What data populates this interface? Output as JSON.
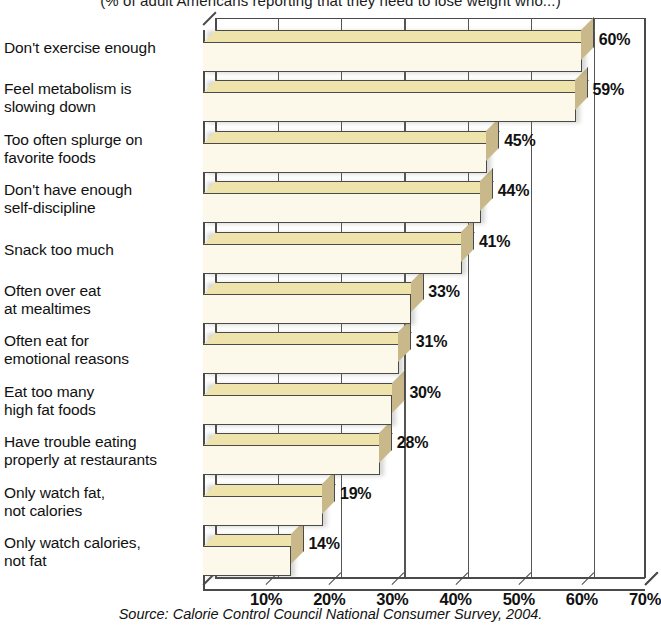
{
  "chart_data": {
    "type": "bar",
    "orientation": "horizontal",
    "title": "(% of adult Americans reporting that they need to lose weight who...)",
    "xlabel": "",
    "ylabel": "",
    "xlim": [
      0,
      70
    ],
    "grid": true,
    "legend": null,
    "source": "Source: Calorie Control Council National Consumer Survey, 2004.",
    "categories": [
      "Don't exercise enough",
      "Feel metabolism is slowing down",
      "Too often splurge on favorite foods",
      "Don't have enough self-discipline",
      "Snack too much",
      "Often over eat at mealtimes",
      "Often eat for emotional reasons",
      "Eat too many high fat foods",
      "Have trouble eating properly at restaurants",
      "Only watch fat, not calories",
      "Only watch calories, not fat"
    ],
    "category_lines": [
      [
        "Don't exercise enough"
      ],
      [
        "Feel metabolism is",
        "slowing down"
      ],
      [
        "Too often splurge on",
        "favorite foods"
      ],
      [
        "Don't have enough",
        "self-discipline"
      ],
      [
        "Snack too much"
      ],
      [
        "Often over eat",
        "at mealtimes"
      ],
      [
        "Often eat for",
        "emotional reasons"
      ],
      [
        "Eat too many",
        "high fat foods"
      ],
      [
        "Have trouble eating",
        "properly at restaurants"
      ],
      [
        "Only watch fat,",
        "not calories"
      ],
      [
        "Only watch calories,",
        "not fat"
      ]
    ],
    "values": [
      60,
      59,
      45,
      44,
      41,
      33,
      31,
      30,
      28,
      19,
      14
    ],
    "value_labels": [
      "60%",
      "59%",
      "45%",
      "44%",
      "41%",
      "33%",
      "31%",
      "30%",
      "28%",
      "19%",
      "14%"
    ],
    "xticks": [
      10,
      20,
      30,
      40,
      50,
      60,
      70
    ],
    "xtick_labels": [
      "10%",
      "20%",
      "30%",
      "40%",
      "50%",
      "60%",
      "70%"
    ],
    "colors": {
      "bar_front": "#FCF9EA",
      "bar_top": "#EFE3AC",
      "bar_side": "#C9B98A",
      "outline": "#4a4a4a",
      "background": "#ffffff",
      "text": "#111111"
    }
  }
}
